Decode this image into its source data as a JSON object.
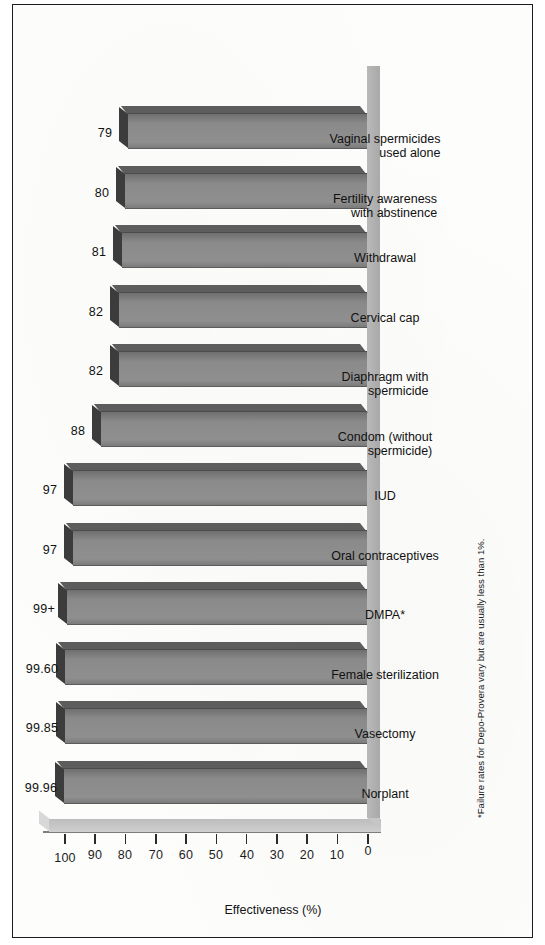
{
  "figure": {
    "axis_title": "Effectiveness (%)",
    "footnote": "*Failure rates for Depo-Provera vary but are usually less than 1%.",
    "bar_fill_color": "#8a8a8a",
    "bar_top_color": "#3c3c3c",
    "floor_color": "#b2b2b2",
    "text_color": "#111111"
  },
  "chart_data": {
    "type": "bar",
    "title": "",
    "subtitle": "",
    "xlabel": "",
    "ylabel": "Effectiveness (%)",
    "ylim": [
      0,
      105
    ],
    "yticks": [
      0,
      10,
      20,
      30,
      40,
      50,
      60,
      70,
      80,
      90,
      100
    ],
    "grid": false,
    "legend": false,
    "orientation": "vertical-3d",
    "categories": [
      "Norplant",
      "Vasectomy",
      "Female sterilization",
      "DMPA*",
      "Oral contraceptives",
      "IUD",
      "Condom (without spermicide)",
      "Diaphragm with spermicide",
      "Cervical cap",
      "Withdrawal",
      "Fertility awareness with abstinence",
      "Vaginal spermicides used alone"
    ],
    "category_lines": [
      [
        "Norplant"
      ],
      [
        "Vasectomy"
      ],
      [
        "Female sterilization"
      ],
      [
        "DMPA*"
      ],
      [
        "Oral contraceptives"
      ],
      [
        "IUD"
      ],
      [
        "Condom (without",
        "spermicide)"
      ],
      [
        "Diaphragm with",
        "spermicide"
      ],
      [
        "Cervical cap"
      ],
      [
        "Withdrawal"
      ],
      [
        "Fertility awareness",
        "with abstinence"
      ],
      [
        "Vaginal spermicides",
        "used alone"
      ]
    ],
    "values": [
      99.96,
      99.85,
      99.6,
      99,
      97,
      97,
      88,
      82,
      82,
      81,
      80,
      79
    ],
    "value_labels": [
      "99.96",
      "99.85",
      "99.60",
      "99+",
      "97",
      "97",
      "88",
      "82",
      "82",
      "81",
      "80",
      "79"
    ],
    "annotations": [
      "*Failure rates for Depo-Provera vary but are usually less than 1%."
    ]
  },
  "ticks": [
    {
      "label": "0",
      "value": 0
    },
    {
      "label": "10",
      "value": 10
    },
    {
      "label": "20",
      "value": 20
    },
    {
      "label": "30",
      "value": 30
    },
    {
      "label": "40",
      "value": 40
    },
    {
      "label": "50",
      "value": 50
    },
    {
      "label": "60",
      "value": 60
    },
    {
      "label": "70",
      "value": 70
    },
    {
      "label": "80",
      "value": 80
    },
    {
      "label": "90",
      "value": 90
    },
    {
      "label": "100",
      "value": 100
    }
  ]
}
